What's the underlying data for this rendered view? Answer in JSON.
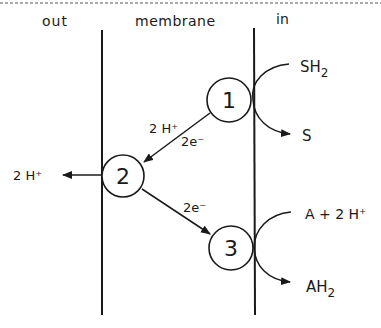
{
  "regions": {
    "out": "out",
    "membrane": "membrane",
    "in": "in"
  },
  "complexes": [
    {
      "id": "1",
      "label": "1"
    },
    {
      "id": "2",
      "label": "2"
    },
    {
      "id": "3",
      "label": "3"
    }
  ],
  "labels": {
    "sh2_main": "SH",
    "sh2_sub": "2",
    "s": "S",
    "h_plus_1_to_2": "2 H⁺",
    "e_1_to_2": "2e⁻",
    "h_plus_out": "2 H⁺",
    "e_2_to_3": "2e⁻",
    "a_plus_2h": "A + 2 H⁺",
    "ah2_main": "AH",
    "ah2_sub": "2"
  },
  "colors": {
    "ink": "#1a1a1a",
    "background": "#ffffff"
  }
}
